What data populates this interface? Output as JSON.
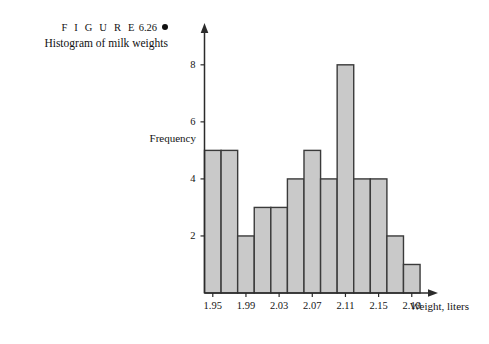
{
  "caption": {
    "figure_label": "F I G U R E",
    "figure_number": "6.26",
    "bullet": "filled-circle",
    "title": "Histogram of milk weights"
  },
  "chart_data": {
    "type": "bar",
    "title": "Histogram of milk weights",
    "xlabel": "Weight, liters",
    "ylabel": "Frequency",
    "bin_width": 0.02,
    "bin_starts": [
      1.94,
      1.96,
      1.98,
      2.0,
      2.02,
      2.04,
      2.06,
      2.08,
      2.1,
      2.12,
      2.14,
      2.16,
      2.18
    ],
    "categories": [
      "1.94-1.96",
      "1.96-1.98",
      "1.98-2.00",
      "2.00-2.02",
      "2.02-2.04",
      "2.04-2.06",
      "2.06-2.08",
      "2.08-2.10",
      "2.10-2.12",
      "2.12-2.14",
      "2.14-2.16",
      "2.16-2.18",
      "2.18-2.20"
    ],
    "values": [
      5,
      5,
      2,
      3,
      3,
      4,
      5,
      4,
      8,
      4,
      4,
      2,
      1
    ],
    "xticks": [
      "1.95",
      "1.99",
      "2.03",
      "2.07",
      "2.11",
      "2.15",
      "2.19"
    ],
    "xtick_values": [
      1.95,
      1.99,
      2.03,
      2.07,
      2.11,
      2.15,
      2.19
    ],
    "yticks": [
      "2",
      "4",
      "6",
      "8"
    ],
    "ytick_values": [
      2,
      4,
      6,
      8
    ],
    "xlim": [
      1.94,
      2.215
    ],
    "ylim": [
      0,
      8.8
    ],
    "grid": false,
    "legend": false,
    "bar_fill_color": "#c9c9c9",
    "bar_edge_color": "#3a3a3a",
    "axis_color": "#2b2b2b",
    "background_color": "#ffffff"
  }
}
